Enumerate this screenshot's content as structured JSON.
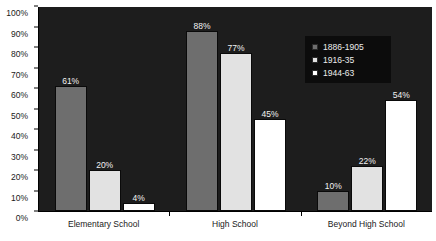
{
  "chart_data": {
    "type": "bar",
    "title": "",
    "xlabel": "",
    "ylabel": "",
    "categories": [
      "Elementary School",
      "High School",
      "Beyond High School"
    ],
    "series": [
      {
        "name": "1886-1905",
        "color": "#6e6e6e",
        "values": [
          61,
          20,
          10
        ],
        "labels": [
          "61%",
          "20%",
          "10%"
        ]
      },
      {
        "name": "1916-35",
        "color": "#e2e2e2",
        "values": [
          77,
          77,
          22
        ],
        "labels": [
          "20%",
          "77%",
          "22%"
        ]
      },
      {
        "name": "1944-63",
        "color": "#ffffff",
        "values": [
          4,
          45,
          54
        ],
        "labels": [
          "4%",
          "45%",
          "54%"
        ]
      }
    ],
    "grouped_values": [
      {
        "category": "Elementary School",
        "values": [
          61,
          20,
          4
        ],
        "labels": [
          "61%",
          "20%",
          "4%"
        ]
      },
      {
        "category": "High School",
        "values": [
          88,
          77,
          45
        ],
        "labels": [
          "88%",
          "77%",
          "45%"
        ]
      },
      {
        "category": "Beyond High School",
        "values": [
          10,
          22,
          54
        ],
        "labels": [
          "10%",
          "22%",
          "54%"
        ]
      }
    ],
    "ylim": [
      0,
      100
    ],
    "ytick_labels": [
      "100%",
      "90%",
      "80%",
      "70%",
      "60%",
      "50%",
      "40%",
      "30%",
      "20%",
      "10%",
      "0%"
    ],
    "ytick_values": [
      100,
      90,
      80,
      70,
      60,
      50,
      40,
      30,
      20,
      10,
      0
    ],
    "grid": false,
    "legend_position": "upper-right",
    "plot_background": "#1d1d1d"
  },
  "legend": {
    "entries": [
      {
        "label": "1886-1905"
      },
      {
        "label": "1916-35"
      },
      {
        "label": "1944-63"
      }
    ]
  },
  "captions": {
    "top_cut": "",
    "bottom_cut": ""
  }
}
